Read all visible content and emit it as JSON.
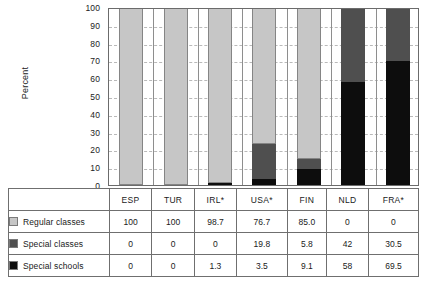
{
  "chart_data": {
    "type": "bar",
    "subtype": "stacked-column-100",
    "title": "",
    "xlabel": "",
    "ylabel": "Percent",
    "ylim": [
      0,
      100
    ],
    "yticks": [
      100,
      90,
      80,
      70,
      60,
      50,
      40,
      30,
      20,
      10,
      0
    ],
    "grid": true,
    "legend_position": "table-left",
    "categories": [
      "ESP",
      "TUR",
      "IRL*",
      "USA*",
      "FIN",
      "NLD",
      "FRA*"
    ],
    "series": [
      {
        "name": "Regular classes",
        "color": "#c6c6c6",
        "values": [
          100,
          100,
          98.7,
          76.7,
          85.0,
          0,
          0
        ],
        "labels": [
          "100",
          "100",
          "98.7",
          "76.7",
          "85.0",
          "0",
          "0"
        ]
      },
      {
        "name": "Special classes",
        "color": "#4f4f4f",
        "values": [
          0,
          0,
          0,
          19.8,
          5.8,
          42,
          30.5
        ],
        "labels": [
          "0",
          "0",
          "0",
          "19.8",
          "5.8",
          "42",
          "30.5"
        ]
      },
      {
        "name": "Special schools",
        "color": "#0d0d0d",
        "values": [
          0,
          0,
          1.3,
          3.5,
          9.1,
          58,
          69.5
        ],
        "labels": [
          "0",
          "0",
          "1.3",
          "3.5",
          "9.1",
          "58",
          "69.5"
        ]
      }
    ]
  },
  "axis": {
    "y_title": "Percent",
    "y_ticks": [
      "100",
      "90",
      "80",
      "70",
      "60",
      "50",
      "40",
      "30",
      "20",
      "10",
      "0"
    ]
  },
  "table": {
    "header_blank": "",
    "columns": [
      "ESP",
      "TUR",
      "IRL*",
      "USA*",
      "FIN",
      "NLD",
      "FRA*"
    ],
    "rows": [
      {
        "label": "Regular classes",
        "swatch": "light-gray-swatch",
        "cells": [
          "100",
          "100",
          "98.7",
          "76.7",
          "85.0",
          "0",
          "0"
        ]
      },
      {
        "label": "Special classes",
        "swatch": "dark-gray-swatch",
        "cells": [
          "0",
          "0",
          "0",
          "19.8",
          "5.8",
          "42",
          "30.5"
        ]
      },
      {
        "label": "Special schools",
        "swatch": "black-swatch",
        "cells": [
          "0",
          "0",
          "1.3",
          "3.5",
          "9.1",
          "58",
          "69.5"
        ]
      }
    ]
  },
  "colors": {
    "regular": "#c6c6c6",
    "special_classes": "#4f4f4f",
    "special_schools": "#0d0d0d",
    "grid": "#b9b9b9",
    "frame": "#6b6b6b",
    "background": "#ffffff"
  }
}
